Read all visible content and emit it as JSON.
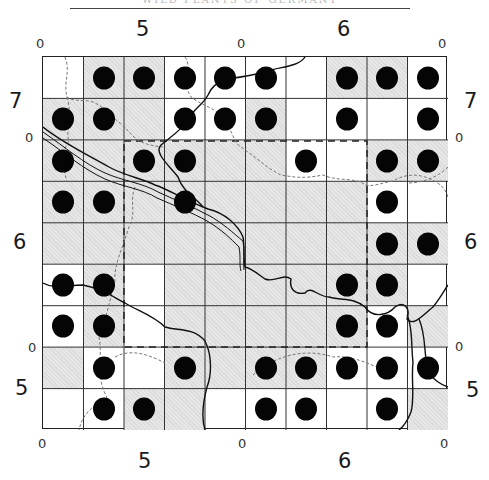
{
  "map": {
    "title": "WILD PLANTS OF GERMANY",
    "grid": {
      "columns": 10,
      "rows": 9,
      "cells": [
        [
          {
            "shaded": false,
            "dot": false
          },
          {
            "shaded": true,
            "dot": true
          },
          {
            "shaded": true,
            "dot": true
          },
          {
            "shaded": false,
            "dot": true
          },
          {
            "shaded": false,
            "dot": true
          },
          {
            "shaded": false,
            "dot": true
          },
          {
            "shaded": false,
            "dot": false
          },
          {
            "shaded": true,
            "dot": true
          },
          {
            "shaded": true,
            "dot": true
          },
          {
            "shaded": false,
            "dot": true
          }
        ],
        [
          {
            "shaded": true,
            "dot": true
          },
          {
            "shaded": true,
            "dot": true
          },
          {
            "shaded": true,
            "dot": false
          },
          {
            "shaded": false,
            "dot": true
          },
          {
            "shaded": false,
            "dot": true
          },
          {
            "shaded": true,
            "dot": true
          },
          {
            "shaded": false,
            "dot": false
          },
          {
            "shaded": false,
            "dot": true
          },
          {
            "shaded": false,
            "dot": false
          },
          {
            "shaded": false,
            "dot": true
          }
        ],
        [
          {
            "shaded": true,
            "dot": true
          },
          {
            "shaded": true,
            "dot": false
          },
          {
            "shaded": true,
            "dot": true
          },
          {
            "shaded": true,
            "dot": true
          },
          {
            "shaded": true,
            "dot": false
          },
          {
            "shaded": true,
            "dot": false
          },
          {
            "shaded": false,
            "dot": true
          },
          {
            "shaded": false,
            "dot": false
          },
          {
            "shaded": true,
            "dot": true
          },
          {
            "shaded": true,
            "dot": true
          }
        ],
        [
          {
            "shaded": true,
            "dot": true
          },
          {
            "shaded": true,
            "dot": true
          },
          {
            "shaded": true,
            "dot": false
          },
          {
            "shaded": true,
            "dot": true
          },
          {
            "shaded": true,
            "dot": false
          },
          {
            "shaded": true,
            "dot": false
          },
          {
            "shaded": true,
            "dot": false
          },
          {
            "shaded": true,
            "dot": false
          },
          {
            "shaded": false,
            "dot": true
          },
          {
            "shaded": false,
            "dot": false
          }
        ],
        [
          {
            "shaded": true,
            "dot": false
          },
          {
            "shaded": true,
            "dot": false
          },
          {
            "shaded": true,
            "dot": false
          },
          {
            "shaded": true,
            "dot": false
          },
          {
            "shaded": true,
            "dot": false
          },
          {
            "shaded": true,
            "dot": false
          },
          {
            "shaded": true,
            "dot": false
          },
          {
            "shaded": true,
            "dot": false
          },
          {
            "shaded": true,
            "dot": true
          },
          {
            "shaded": true,
            "dot": true
          }
        ],
        [
          {
            "shaded": false,
            "dot": true
          },
          {
            "shaded": true,
            "dot": true
          },
          {
            "shaded": false,
            "dot": false
          },
          {
            "shaded": true,
            "dot": false
          },
          {
            "shaded": true,
            "dot": false
          },
          {
            "shaded": true,
            "dot": false
          },
          {
            "shaded": true,
            "dot": false
          },
          {
            "shaded": true,
            "dot": true
          },
          {
            "shaded": true,
            "dot": true
          },
          {
            "shaded": false,
            "dot": false
          }
        ],
        [
          {
            "shaded": false,
            "dot": true
          },
          {
            "shaded": true,
            "dot": true
          },
          {
            "shaded": false,
            "dot": false
          },
          {
            "shaded": true,
            "dot": false
          },
          {
            "shaded": true,
            "dot": false
          },
          {
            "shaded": true,
            "dot": false
          },
          {
            "shaded": true,
            "dot": false
          },
          {
            "shaded": true,
            "dot": true
          },
          {
            "shaded": false,
            "dot": true
          },
          {
            "shaded": true,
            "dot": false
          }
        ],
        [
          {
            "shaded": true,
            "dot": false
          },
          {
            "shaded": false,
            "dot": true
          },
          {
            "shaded": false,
            "dot": false
          },
          {
            "shaded": true,
            "dot": true
          },
          {
            "shaded": true,
            "dot": false
          },
          {
            "shaded": true,
            "dot": true
          },
          {
            "shaded": true,
            "dot": true
          },
          {
            "shaded": false,
            "dot": true
          },
          {
            "shaded": false,
            "dot": true
          },
          {
            "shaded": false,
            "dot": true
          }
        ],
        [
          {
            "shaded": false,
            "dot": false
          },
          {
            "shaded": false,
            "dot": true
          },
          {
            "shaded": true,
            "dot": true
          },
          {
            "shaded": true,
            "dot": false
          },
          {
            "shaded": false,
            "dot": false
          },
          {
            "shaded": false,
            "dot": true
          },
          {
            "shaded": false,
            "dot": true
          },
          {
            "shaded": false,
            "dot": false
          },
          {
            "shaded": false,
            "dot": true
          },
          {
            "shaded": true,
            "dot": false
          }
        ]
      ]
    },
    "axis_labels": {
      "top": [
        {
          "text": "0",
          "x": 36,
          "y": 37,
          "size": "small"
        },
        {
          "text": "5",
          "x": 136,
          "y": 19,
          "size": "big"
        },
        {
          "text": "0",
          "x": 237,
          "y": 37,
          "size": "small"
        },
        {
          "text": "6",
          "x": 337,
          "y": 19,
          "size": "big"
        },
        {
          "text": "0",
          "x": 438,
          "y": 37,
          "size": "small"
        }
      ],
      "bottom": [
        {
          "text": "0",
          "x": 38,
          "y": 437,
          "size": "small"
        },
        {
          "text": "5",
          "x": 138,
          "y": 451,
          "size": "big"
        },
        {
          "text": "0",
          "x": 238,
          "y": 437,
          "size": "small"
        },
        {
          "text": "6",
          "x": 338,
          "y": 451,
          "size": "big"
        },
        {
          "text": "0",
          "x": 440,
          "y": 437,
          "size": "small"
        }
      ],
      "left": [
        {
          "text": "7",
          "x": 9,
          "y": 91,
          "size": "big"
        },
        {
          "text": "0",
          "x": 25,
          "y": 131,
          "size": "small"
        },
        {
          "text": "6",
          "x": 13,
          "y": 232,
          "size": "big"
        },
        {
          "text": "0",
          "x": 28,
          "y": 341,
          "size": "small"
        },
        {
          "text": "5",
          "x": 15,
          "y": 378,
          "size": "big"
        }
      ],
      "right": [
        {
          "text": "7",
          "x": 464,
          "y": 91,
          "size": "big"
        },
        {
          "text": "0",
          "x": 455,
          "y": 131,
          "size": "small"
        },
        {
          "text": "6",
          "x": 464,
          "y": 232,
          "size": "big"
        },
        {
          "text": "0",
          "x": 455,
          "y": 340,
          "size": "small"
        },
        {
          "text": "5",
          "x": 466,
          "y": 380,
          "size": "big"
        }
      ]
    },
    "colors": {
      "shade": "#e6e6e6",
      "dot": "#050505",
      "grid_line": "#222222"
    }
  }
}
